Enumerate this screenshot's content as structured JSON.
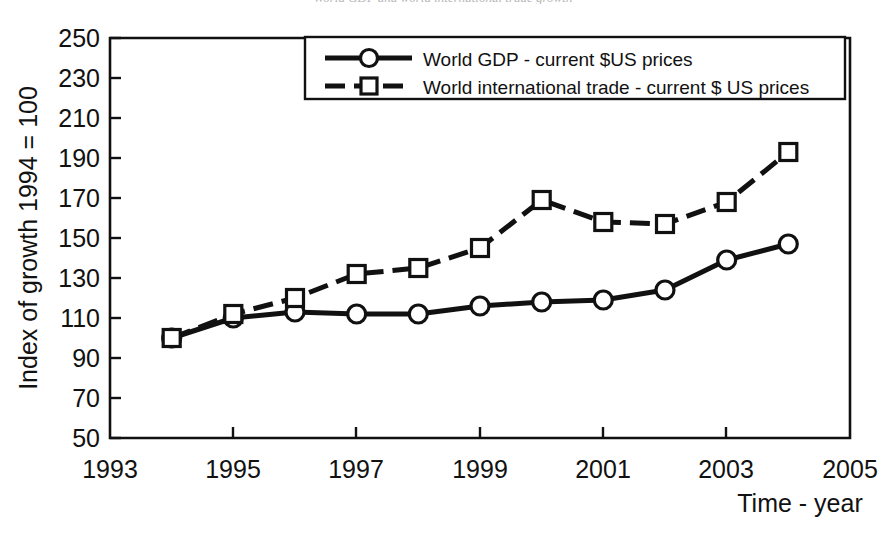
{
  "chart_data": {
    "type": "line",
    "title": "World GDP and world international trade growth",
    "xlabel": "Time - year",
    "ylabel": "Index of growth 1994 = 100",
    "xlim": [
      1993,
      2005
    ],
    "ylim": [
      50,
      250
    ],
    "xticks": [
      "1993",
      "1995",
      "1997",
      "1999",
      "2001",
      "2003",
      "2005"
    ],
    "xtick_values": [
      1993,
      1995,
      1997,
      1999,
      2001,
      2003,
      2005
    ],
    "yticks": [
      "50",
      "70",
      "90",
      "110",
      "130",
      "150",
      "170",
      "190",
      "210",
      "230",
      "250"
    ],
    "ytick_values": [
      50,
      70,
      90,
      110,
      130,
      150,
      170,
      190,
      210,
      230,
      250
    ],
    "grid": false,
    "legend_position": "top-center",
    "x": [
      1994,
      1995,
      1996,
      1997,
      1998,
      1999,
      2000,
      2001,
      2002,
      2003,
      2004
    ],
    "series": [
      {
        "name": "World GDP - current $US prices",
        "marker": "circle",
        "linestyle": "solid",
        "color": "#111111",
        "values": [
          100,
          110,
          113,
          112,
          112,
          116,
          118,
          119,
          124,
          139,
          147
        ]
      },
      {
        "name": "World international trade - current $ US prices",
        "marker": "square",
        "linestyle": "dashed",
        "color": "#111111",
        "values": [
          100,
          112,
          120,
          132,
          135,
          145,
          169,
          158,
          157,
          168,
          193
        ]
      }
    ]
  },
  "legend": {
    "entries": [
      {
        "label": "World GDP - current $US prices",
        "marker": "circle-marker"
      },
      {
        "label": "World international trade - current $ US prices",
        "marker": "square-marker"
      }
    ]
  },
  "axes": {
    "y_axis_title": "Index of growth 1994 = 100",
    "x_axis_title": "Time - year"
  }
}
